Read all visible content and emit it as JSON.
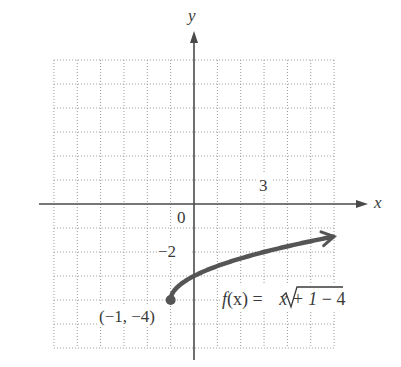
{
  "chart_data": {
    "type": "line",
    "title": "",
    "xlabel": "x",
    "ylabel": "y",
    "xlim": [
      -6,
      6
    ],
    "ylim": [
      -6,
      6
    ],
    "grid": true,
    "grid_step": 1,
    "tick_labels": {
      "origin": "0",
      "x": [
        {
          "value": 3,
          "label": "3"
        }
      ],
      "y": [
        {
          "value": -2,
          "label": "−2"
        }
      ]
    },
    "series": [
      {
        "name": "f(x) = √(x + 1) − 4",
        "function": "sqrt(x+1)-4",
        "domain_start": -1,
        "domain_end": 6,
        "end_arrow": true,
        "color": "#555555",
        "points": [
          [
            -1,
            -4
          ],
          [
            -0.75,
            -3.5
          ],
          [
            -0.5,
            -3.29
          ],
          [
            0,
            -3
          ],
          [
            1,
            -2.59
          ],
          [
            2,
            -2.27
          ],
          [
            3,
            -2
          ],
          [
            4,
            -1.76
          ],
          [
            5,
            -1.55
          ],
          [
            6,
            -1.35
          ]
        ]
      }
    ],
    "annotations": [
      {
        "text": "(−1, −4)",
        "x": -1,
        "y": -4,
        "marker": "filled-dot"
      },
      {
        "text_parts": {
          "f": "f",
          "arg": "(x) = ",
          "radicand": "x + 1",
          "tail": " − 4"
        },
        "legend_for": 0
      }
    ]
  }
}
